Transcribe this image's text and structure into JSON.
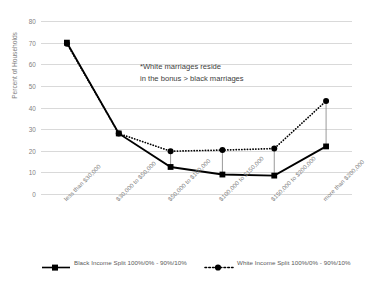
{
  "chart_data": {
    "type": "line",
    "title": "",
    "xlabel": "",
    "ylabel": "Percent of Households",
    "ylim": [
      0,
      80
    ],
    "ytick_step": 10,
    "yticks": [
      "0",
      "10",
      "20",
      "30",
      "40",
      "50",
      "60",
      "70",
      "80"
    ],
    "grid": true,
    "legend_position": "bottom",
    "categories": [
      "less than $30,000",
      "$30,000 to $50,000",
      "$50,000 to $100,000",
      "$100,000 to $150,000",
      "$150,000 to $200,000",
      "more than $200,000"
    ],
    "series": [
      {
        "name": "Black Income Split 100%/0% - 90%/10%",
        "style": "solid",
        "marker": "square",
        "color": "#000000",
        "values": [
          70,
          28,
          12.5,
          9,
          8.5,
          22
        ]
      },
      {
        "name": "White Income Split 100%/0% - 90%/10%",
        "style": "dotted",
        "marker": "circle",
        "color": "#000000",
        "values": [
          69.5,
          28,
          19.8,
          20.3,
          21,
          43
        ]
      }
    ],
    "annotations": [
      "*White marriages reside",
      "in the bonus > black marriages"
    ]
  },
  "legend": {
    "items": [
      {
        "label": "Black Income Split 100%/0% - 90%/10%"
      },
      {
        "label": "White Income Split 100%/0% - 90%/10%"
      }
    ]
  },
  "colors": {
    "gridline": "#d9d9d9",
    "tick_text": "#7f7f7f",
    "series_line": "#000000",
    "annotation_text": "#404040"
  }
}
